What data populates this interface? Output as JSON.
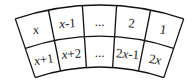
{
  "diagram": {
    "type": "curved-table",
    "rows": 2,
    "columns": 5,
    "line_color": "#111111",
    "background": "#ffffff",
    "cells": [
      [
        {
          "parts": [
            {
              "t": "x",
              "var": true
            }
          ]
        },
        {
          "parts": [
            {
              "t": "x",
              "var": true
            },
            {
              "t": "-1",
              "var": false
            }
          ]
        },
        {
          "parts": [
            {
              "t": "...",
              "var": false
            }
          ]
        },
        {
          "parts": [
            {
              "t": "2",
              "var": false
            }
          ]
        },
        {
          "parts": [
            {
              "t": "1",
              "var": false
            }
          ]
        }
      ],
      [
        {
          "parts": [
            {
              "t": "x",
              "var": true
            },
            {
              "t": "+1",
              "var": false
            }
          ]
        },
        {
          "parts": [
            {
              "t": "x",
              "var": true
            },
            {
              "t": "+2",
              "var": false
            }
          ]
        },
        {
          "parts": [
            {
              "t": "...",
              "var": false
            }
          ]
        },
        {
          "parts": [
            {
              "t": "2",
              "var": false
            },
            {
              "t": "x",
              "var": true
            },
            {
              "t": "-1",
              "var": false
            }
          ]
        },
        {
          "parts": [
            {
              "t": "2",
              "var": false
            },
            {
              "t": "x",
              "var": true
            }
          ]
        }
      ]
    ],
    "cell_text": [
      [
        "x",
        "x-1",
        "...",
        "2",
        "1"
      ],
      [
        "x+1",
        "x+2",
        "...",
        "2x-1",
        "2x"
      ]
    ]
  }
}
